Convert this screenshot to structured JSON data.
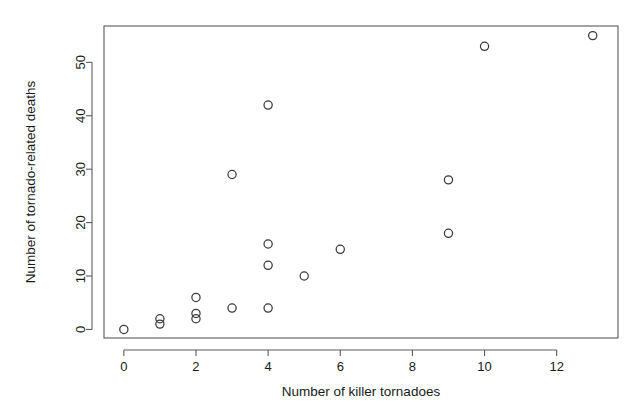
{
  "chart_data": {
    "type": "scatter",
    "title": "",
    "xlabel": "Number of killer tornadoes",
    "ylabel": "Number of tornado-related deaths",
    "x": [
      0,
      1,
      1,
      2,
      2,
      2,
      3,
      3,
      4,
      4,
      4,
      4,
      5,
      6,
      9,
      9,
      10,
      13
    ],
    "y": [
      0,
      1,
      2,
      2,
      3,
      6,
      4,
      29,
      4,
      12,
      16,
      42,
      10,
      15,
      18,
      28,
      53,
      55
    ],
    "points": [
      {
        "x": 0,
        "y": 0
      },
      {
        "x": 1,
        "y": 1
      },
      {
        "x": 1,
        "y": 2
      },
      {
        "x": 2,
        "y": 2
      },
      {
        "x": 2,
        "y": 3
      },
      {
        "x": 2,
        "y": 6
      },
      {
        "x": 3,
        "y": 4
      },
      {
        "x": 3,
        "y": 29
      },
      {
        "x": 4,
        "y": 4
      },
      {
        "x": 4,
        "y": 12
      },
      {
        "x": 4,
        "y": 16
      },
      {
        "x": 4,
        "y": 42
      },
      {
        "x": 5,
        "y": 10
      },
      {
        "x": 6,
        "y": 15
      },
      {
        "x": 9,
        "y": 18
      },
      {
        "x": 9,
        "y": 28
      },
      {
        "x": 10,
        "y": 53
      },
      {
        "x": 13,
        "y": 55
      }
    ],
    "xticks": [
      0,
      2,
      4,
      6,
      8,
      10,
      12
    ],
    "xticklabels": [
      "0",
      "2",
      "4",
      "6",
      "8",
      "10",
      "12"
    ],
    "yticks": [
      0,
      10,
      20,
      30,
      40,
      50
    ],
    "yticklabels": [
      "0",
      "10",
      "20",
      "30",
      "40",
      "50"
    ],
    "xlim": [
      -0.55,
      13.7
    ],
    "ylim": [
      -1.6,
      56.8
    ],
    "grid": false,
    "legend": false,
    "marker": "open-circle",
    "marker_color": "#3a3a3a",
    "frame_color": "#5a5a5a",
    "background": "#ffffff"
  }
}
